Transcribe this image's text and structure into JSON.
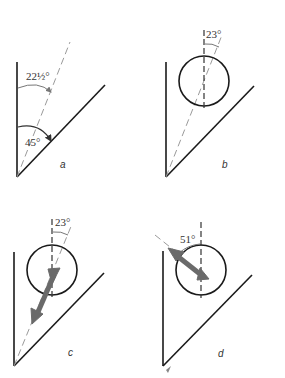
{
  "panels": {
    "a": {
      "label": "a",
      "angle_upper": "22½°",
      "angle_lower": "45°"
    },
    "b": {
      "label": "b",
      "angle": "23°"
    },
    "c": {
      "label": "c",
      "angle": "23°"
    },
    "d": {
      "label": "d",
      "angle": "51°"
    }
  },
  "colors": {
    "line": "#1a1a1a",
    "dashed": "#9a9a9a",
    "arrow": "#6a6a6a"
  }
}
